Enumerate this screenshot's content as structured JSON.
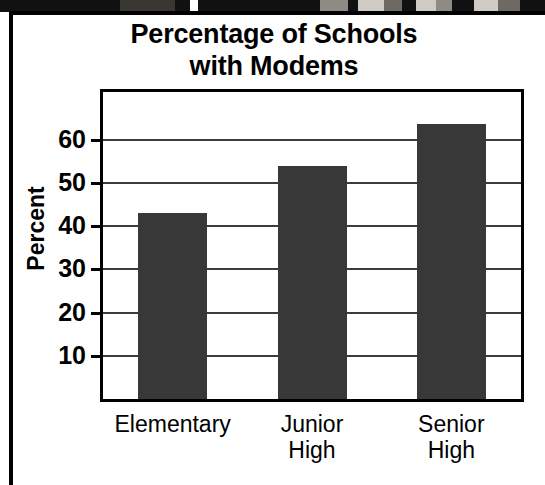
{
  "figure": {
    "title_lines": [
      "Percentage of Schools",
      "with Modems"
    ],
    "photo_strip_caption": "photo-strip"
  },
  "chart_data": {
    "type": "bar",
    "title": "Percentage of Schools with Modems",
    "categories": [
      "Elementary",
      "Junior High",
      "Senior High"
    ],
    "category_lines": [
      [
        "Elementary"
      ],
      [
        "Junior",
        "High"
      ],
      [
        "Senior",
        "High"
      ]
    ],
    "values": [
      43,
      54,
      63.5
    ],
    "xlabel": "",
    "ylabel": "Percent",
    "ylim": [
      0,
      71
    ],
    "yticks": [
      10,
      20,
      30,
      40,
      50,
      60
    ],
    "ytick_labels": [
      "10",
      "20",
      "30",
      "40",
      "50",
      "60"
    ],
    "grid": true,
    "grid_axis": "y",
    "legend": false,
    "bar_color": "#383838",
    "axis_color": "#000000",
    "grid_color": "#3c3c3c",
    "background_color": "#ffffff"
  }
}
